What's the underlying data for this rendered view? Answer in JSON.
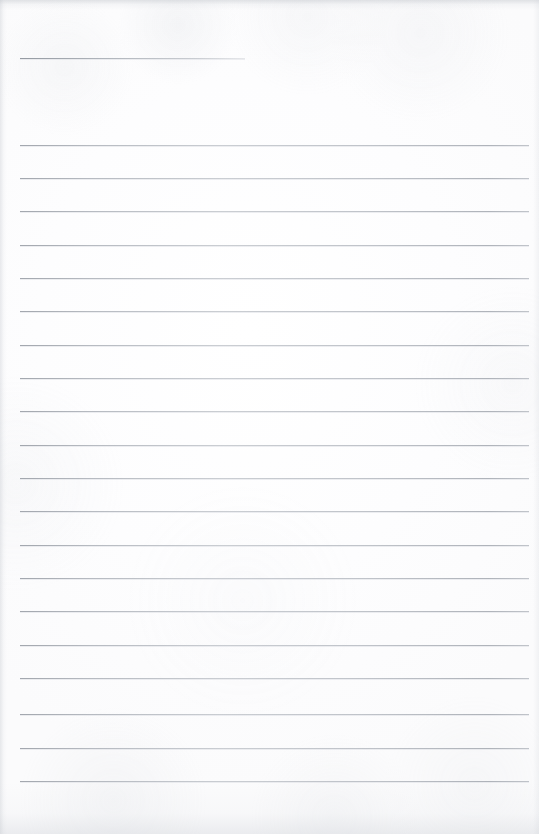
{
  "document": {
    "kind": "scanned-blank-ruled-paper",
    "page_label": "",
    "orientation": "portrait",
    "width_px": 539,
    "height_px": 834,
    "content_text": "",
    "background_color": "#fdfdfd",
    "rule_color": "#aeb3ba",
    "edge_shadow_color": "#c0c5cc"
  },
  "ruling": {
    "left_px": 20,
    "right_px": 529,
    "line_height_px": 1,
    "spacing_px": 33.5,
    "header_rule": {
      "name": "header-rule",
      "y_px": 58,
      "x_start_px": 20,
      "x_end_px": 245,
      "width_px": 225,
      "full_width": false
    },
    "body_rules": [
      {
        "index": 1,
        "y_px": 145
      },
      {
        "index": 2,
        "y_px": 178
      },
      {
        "index": 3,
        "y_px": 211
      },
      {
        "index": 4,
        "y_px": 245
      },
      {
        "index": 5,
        "y_px": 278
      },
      {
        "index": 6,
        "y_px": 311
      },
      {
        "index": 7,
        "y_px": 345
      },
      {
        "index": 8,
        "y_px": 378
      },
      {
        "index": 9,
        "y_px": 411
      },
      {
        "index": 10,
        "y_px": 445
      },
      {
        "index": 11,
        "y_px": 478
      },
      {
        "index": 12,
        "y_px": 511
      },
      {
        "index": 13,
        "y_px": 545
      },
      {
        "index": 14,
        "y_px": 578
      },
      {
        "index": 15,
        "y_px": 611
      },
      {
        "index": 16,
        "y_px": 645
      },
      {
        "index": 17,
        "y_px": 678
      },
      {
        "index": 18,
        "y_px": 714
      },
      {
        "index": 19,
        "y_px": 748
      },
      {
        "index": 20,
        "y_px": 781
      }
    ]
  },
  "margins": {
    "top_blank_px": 58,
    "bottom_blank_px": 53,
    "left_px": 20,
    "right_px": 10
  }
}
